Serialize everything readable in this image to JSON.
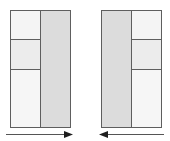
{
  "diagram": {
    "colors": {
      "border": "#5e5e5e",
      "column_fill": "#dcdcdc",
      "cell_top": "#f4f4f4",
      "cell_middle": "#ececec",
      "cell_bottom": "#f6f6f6",
      "arrow": "#222222"
    },
    "left_layout": {
      "column_side": "right",
      "stacked_cells": [
        "top",
        "middle",
        "bottom"
      ],
      "arrow_direction": "right"
    },
    "right_layout": {
      "column_side": "left",
      "stacked_cells": [
        "top",
        "middle",
        "bottom"
      ],
      "arrow_direction": "left"
    }
  }
}
